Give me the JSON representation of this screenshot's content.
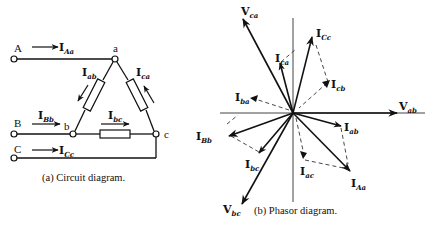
{
  "circuit": {
    "caption": "(a) Circuit diagram.",
    "terminals": [
      "A",
      "B",
      "C"
    ],
    "nodes": [
      "a",
      "b",
      "c"
    ],
    "currents": {
      "Aa": {
        "main": "I",
        "sub": "Aa"
      },
      "Bb": {
        "main": "I",
        "sub": "Bb"
      },
      "Cc": {
        "main": "I",
        "sub": "Cc"
      },
      "ab": {
        "main": "I",
        "sub": "ab"
      },
      "bc": {
        "main": "I",
        "sub": "bc"
      },
      "ca": {
        "main": "I",
        "sub": "ca"
      }
    }
  },
  "phasor": {
    "caption": "(b) Phasor diagram.",
    "voltages": {
      "ab": {
        "main": "V",
        "sub": "ab"
      },
      "ca": {
        "main": "V",
        "sub": "ca"
      },
      "bc": {
        "main": "V",
        "sub": "bc"
      }
    },
    "currents": {
      "Cc": {
        "main": "I",
        "sub": "Cc"
      },
      "ca": {
        "main": "I",
        "sub": "ca"
      },
      "cb": {
        "main": "I",
        "sub": "cb"
      },
      "ba": {
        "main": "I",
        "sub": "ba"
      },
      "Bb": {
        "main": "I",
        "sub": "Bb"
      },
      "bc": {
        "main": "I",
        "sub": "bc"
      },
      "ab": {
        "main": "I",
        "sub": "ab"
      },
      "Aa": {
        "main": "I",
        "sub": "Aa"
      },
      "ac": {
        "main": "I",
        "sub": "ac"
      }
    }
  },
  "colors": {
    "ink": "#111111",
    "background": "#ffffff"
  }
}
